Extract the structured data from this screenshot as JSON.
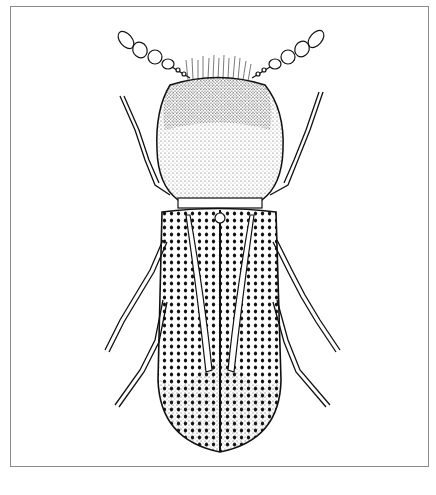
{
  "image": {
    "subject": "beetle",
    "style": "black-and-white stippled scientific illustration",
    "view": "dorsal",
    "frame": {
      "border_color": "#8a8a8a",
      "background": "#ffffff"
    },
    "parts": [
      "antennae",
      "pronotum",
      "elytra",
      "legs",
      "scutellum"
    ]
  },
  "caption": ""
}
